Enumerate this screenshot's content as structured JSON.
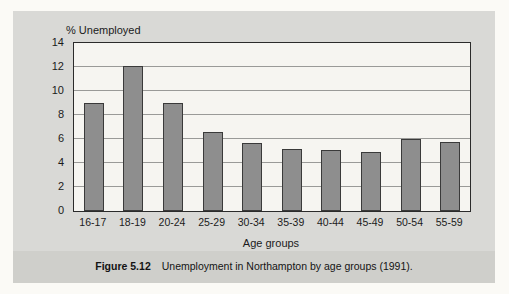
{
  "figure": {
    "caption_label": "Figure 5.12",
    "caption_text": "Unemployment in Northampton by age groups (1991).",
    "panel_bg": "#d9d9d6",
    "caption_band_bg": "#cfcfcb",
    "page_bg": "#fbfaf6"
  },
  "chart_data": {
    "type": "bar",
    "title": "",
    "subtitle": "",
    "xlabel": "Age groups",
    "ylabel": "% Unemployed",
    "categories": [
      "16-17",
      "18-19",
      "20-24",
      "25-29",
      "30-34",
      "35-39",
      "40-44",
      "45-49",
      "50-54",
      "55-59"
    ],
    "values": [
      9.0,
      12.1,
      9.0,
      6.6,
      5.7,
      5.2,
      5.1,
      4.9,
      6.0,
      5.75
    ],
    "ylim": [
      0,
      14
    ],
    "yticks": [
      0,
      2,
      4,
      6,
      8,
      10,
      12,
      14
    ],
    "ytick_labels": [
      "0",
      "2",
      "4",
      "6",
      "8",
      "10",
      "12",
      "14"
    ],
    "grid": true,
    "grid_axis": "y",
    "legend": false,
    "legend_position": "none",
    "bar_color": "#8e8e8e",
    "bar_edge_color": "#3a3a3a",
    "plot_bg": "#f6f5f1",
    "axis_color": "#2b2b2b",
    "grid_color": "#9a9a98"
  }
}
